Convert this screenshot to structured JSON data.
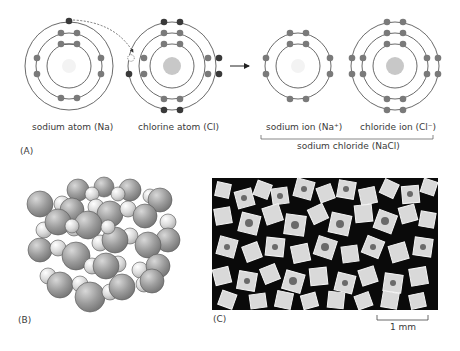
{
  "panel_a": {
    "label": "(A)",
    "sodium_atom": {
      "caption": "sodium atom (Na)",
      "shells": [
        2,
        8,
        1
      ]
    },
    "chlorine_atom": {
      "caption": "chlorine atom (Cl)",
      "shells": [
        2,
        8,
        7
      ]
    },
    "sodium_ion": {
      "caption": "sodium ion (Na⁺)",
      "shells": [
        2,
        8
      ]
    },
    "chloride_ion": {
      "caption": "chloride ion (Cl⁻)",
      "shells": [
        2,
        8,
        8
      ]
    },
    "compound_caption": "sodium chloride (NaCl)",
    "colors": {
      "electron": "#7a7a7a",
      "valence_electron": "#3c3c3c",
      "orbit": "#4a4a4a",
      "na_nucleus": "#f2f2f2",
      "cl_nucleus": "#c8c8c8"
    }
  },
  "panel_b": {
    "label": "(B)",
    "description": "crystal lattice of sodium and chloride ions",
    "colors": {
      "large_ion": "#9a9a9a",
      "small_ion": "#dcdcdc"
    }
  },
  "panel_c": {
    "label": "(C)",
    "description": "micrograph of salt crystals",
    "scale_bar": "1 mm"
  }
}
